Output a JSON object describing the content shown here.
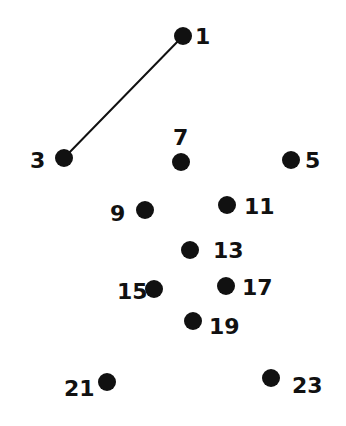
{
  "puzzle": {
    "type": "connect-the-dots",
    "ink_color": "#111111",
    "background": "#ffffff",
    "dot_radius": 9,
    "dots": [
      {
        "n": "1",
        "x": 183,
        "y": 36,
        "lx": 195,
        "ly": 44,
        "anchor": "start"
      },
      {
        "n": "3",
        "x": 64,
        "y": 158,
        "lx": 30,
        "ly": 168,
        "anchor": "start"
      },
      {
        "n": "5",
        "x": 291,
        "y": 160,
        "lx": 305,
        "ly": 168,
        "anchor": "start"
      },
      {
        "n": "7",
        "x": 181,
        "y": 162,
        "lx": 173,
        "ly": 145,
        "anchor": "start"
      },
      {
        "n": "9",
        "x": 145,
        "y": 210,
        "lx": 110,
        "ly": 221,
        "anchor": "start"
      },
      {
        "n": "11",
        "x": 227,
        "y": 205,
        "lx": 244,
        "ly": 214,
        "anchor": "start"
      },
      {
        "n": "13",
        "x": 190,
        "y": 250,
        "lx": 213,
        "ly": 258,
        "anchor": "start"
      },
      {
        "n": "15",
        "x": 154,
        "y": 289,
        "lx": 117,
        "ly": 299,
        "anchor": "start"
      },
      {
        "n": "17",
        "x": 226,
        "y": 286,
        "lx": 242,
        "ly": 295,
        "anchor": "start"
      },
      {
        "n": "19",
        "x": 193,
        "y": 321,
        "lx": 209,
        "ly": 334,
        "anchor": "start"
      },
      {
        "n": "21",
        "x": 107,
        "y": 382,
        "lx": 64,
        "ly": 396,
        "anchor": "start"
      },
      {
        "n": "23",
        "x": 271,
        "y": 378,
        "lx": 292,
        "ly": 393,
        "anchor": "start"
      }
    ],
    "drawn_lines": [
      {
        "from": "1",
        "to": "3"
      }
    ]
  }
}
